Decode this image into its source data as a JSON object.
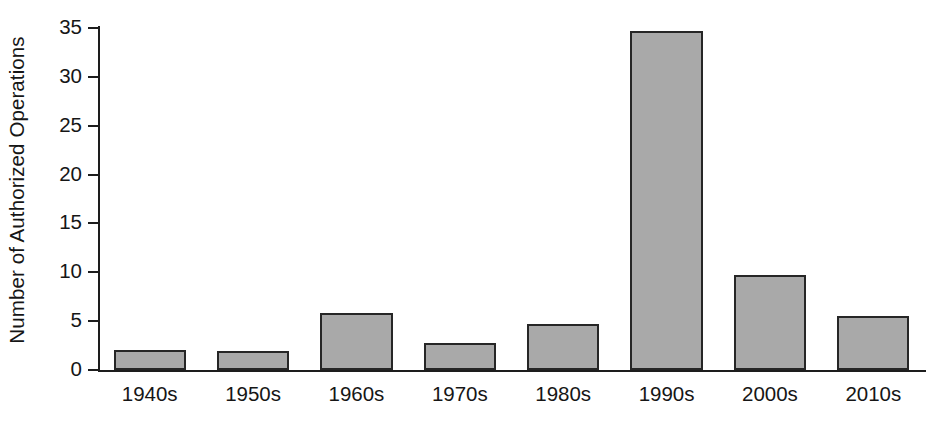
{
  "chart_data": {
    "type": "bar",
    "title": "",
    "xlabel": "",
    "ylabel": "Number of Authorized Operations",
    "categories": [
      "1940s",
      "1950s",
      "1960s",
      "1970s",
      "1980s",
      "1990s",
      "2000s",
      "2010s"
    ],
    "values": [
      2.0,
      1.9,
      5.8,
      2.8,
      4.7,
      34.7,
      9.7,
      5.5
    ],
    "ylim": [
      0,
      35
    ],
    "yticks": [
      0,
      5,
      10,
      15,
      20,
      25,
      30,
      35
    ],
    "ytick_labels": [
      "0",
      "5",
      "10",
      "15",
      "20",
      "25",
      "30",
      "35"
    ],
    "grid": false,
    "legend": null,
    "bar_color": "#a9a9a9",
    "bar_edge_color": "#262626",
    "background_color": "#ffffff",
    "axis_color": "#1d1d1d"
  }
}
